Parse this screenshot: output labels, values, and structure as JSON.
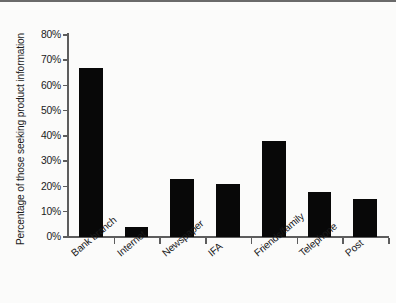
{
  "chart_data": {
    "type": "bar",
    "title": "",
    "xlabel": "",
    "ylabel": "Percentage of those seeking product information",
    "categories": [
      "Bank branch",
      "Internet",
      "Newspaper",
      "IFA",
      "Friends/family",
      "Telephone",
      "Post"
    ],
    "values": [
      67,
      4,
      23,
      21,
      38,
      18,
      15
    ],
    "ylim": [
      0,
      80
    ],
    "ytick_labels": [
      "0%",
      "10%",
      "20%",
      "30%",
      "40%",
      "50%",
      "60%",
      "70%",
      "80%"
    ],
    "ytick_values": [
      0,
      10,
      20,
      30,
      40,
      50,
      60,
      70,
      80
    ],
    "grid": false,
    "legend": false,
    "bar_color": "#080808",
    "axis_color": "#5d5d5d",
    "background_color": "#fbfbfa",
    "xlabel_rotation": -40
  }
}
